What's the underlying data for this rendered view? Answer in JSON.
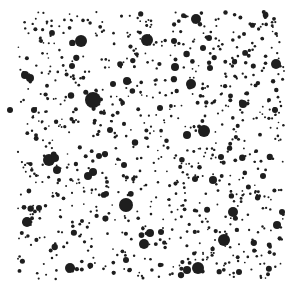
{
  "image": {
    "description": "Black speckle dots of varying sizes scattered on a white background",
    "background": "#ffffff",
    "dot_color": "#1e1e1e",
    "width": 302,
    "height": 292,
    "content_bounds": [
      18,
      12,
      285,
      280
    ]
  },
  "large_dots": [
    [
      81,
      41,
      6
    ],
    [
      93,
      100,
      8
    ],
    [
      147,
      40,
      6
    ],
    [
      196,
      19,
      5
    ],
    [
      204,
      131,
      6
    ],
    [
      224,
      240,
      6
    ],
    [
      233,
      212,
      5
    ],
    [
      126,
      205,
      7
    ],
    [
      70,
      268,
      5
    ],
    [
      49,
      160,
      6
    ],
    [
      27,
      222,
      5
    ],
    [
      25,
      75,
      4
    ],
    [
      276,
      64,
      5
    ],
    [
      191,
      84,
      5
    ],
    [
      175,
      67,
      4
    ],
    [
      127,
      81,
      4
    ],
    [
      113,
      84,
      3
    ],
    [
      144,
      244,
      5
    ],
    [
      150,
      233,
      4
    ],
    [
      198,
      268,
      6
    ],
    [
      187,
      270,
      4
    ],
    [
      213,
      180,
      4
    ],
    [
      243,
      104,
      4
    ],
    [
      275,
      110,
      3
    ],
    [
      93,
      172,
      4
    ],
    [
      88,
      176,
      4
    ],
    [
      10,
      110,
      3
    ],
    [
      30,
      78,
      4
    ],
    [
      99,
      156,
      3
    ],
    [
      209,
      38,
      3
    ],
    [
      187,
      135,
      4
    ],
    [
      203,
      48,
      3
    ],
    [
      57,
      170,
      4
    ],
    [
      55,
      158,
      4
    ],
    [
      282,
      212,
      3
    ],
    [
      277,
      225,
      4
    ],
    [
      210,
      68,
      3
    ],
    [
      174,
      41,
      3
    ],
    [
      110,
      130,
      3
    ],
    [
      160,
      108,
      3
    ],
    [
      221,
      157,
      3
    ],
    [
      39,
      208,
      3
    ],
    [
      72,
      66,
      3
    ],
    [
      34,
      110,
      3
    ],
    [
      161,
      232,
      3
    ],
    [
      244,
      34,
      2
    ],
    [
      263,
      176,
      3
    ],
    [
      124,
      165,
      3
    ],
    [
      82,
      221,
      2
    ],
    [
      126,
      260,
      3
    ],
    [
      239,
      272,
      3
    ],
    [
      269,
      100,
      2
    ],
    [
      195,
      179,
      3
    ],
    [
      104,
      113,
      2
    ],
    [
      59,
      180,
      2
    ]
  ],
  "small_dot_count": 900,
  "small_dot_seed": 7
}
